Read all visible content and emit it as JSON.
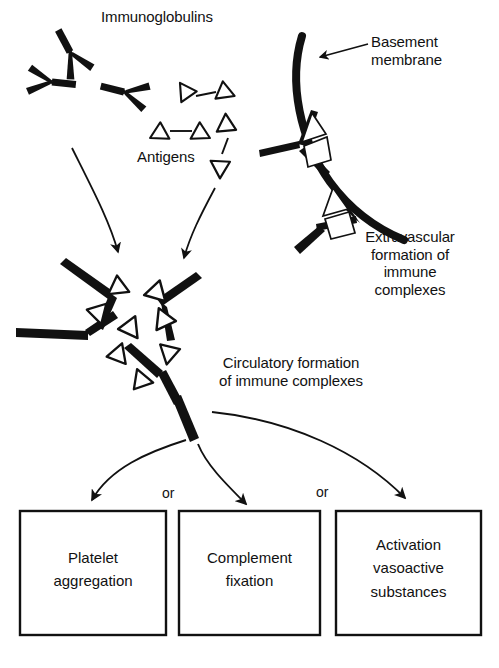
{
  "figure": {
    "type": "biomedical-flow-diagram",
    "background_color": "#ffffff",
    "ink_color": "#111111"
  },
  "labels": {
    "immunoglobulins": "Immunoglobulins",
    "antigens": "Antigens",
    "basement_membrane": "Basement\nmembrane",
    "extravascular": "Extravascular\nformation of\nimmune\ncomplexes",
    "circulatory": "Circulatory formation\nof immune complexes",
    "or_1": "or",
    "or_2": "or"
  },
  "outcome_boxes": [
    {
      "id": "platelet-aggregation",
      "text": "Platelet\naggregation"
    },
    {
      "id": "complement-fixation",
      "text": "Complement\nfixation"
    },
    {
      "id": "activation-vasoactive-substances",
      "text": "Activation\nvasoactive\nsubstances"
    }
  ],
  "legend_shapes": {
    "immunoglobulin": "Y-shaped thick black antibody",
    "antigen": "open white triangle with black outline",
    "basement_membrane": "thick curved black band"
  }
}
